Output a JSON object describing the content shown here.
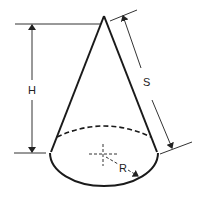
{
  "diagram": {
    "labels": {
      "height": "H",
      "slant": "S",
      "radius": "R"
    },
    "colors": {
      "stroke": "#1a1a1a",
      "dimension": "#333333",
      "background": "#ffffff"
    }
  }
}
